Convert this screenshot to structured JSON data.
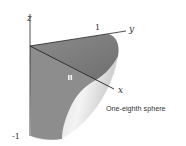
{
  "figure": {
    "caption": "One-eighth sphere",
    "axes": {
      "z_label": "z",
      "y_label": "y",
      "x_label": "x",
      "y_tick": "1",
      "z_tick": "-1"
    },
    "marker_label": "▮▮",
    "colors": {
      "flat_face": "#8a8a8a",
      "top_face": "#7a7a7a",
      "curved_light": "#e8e8e8",
      "curved_mid": "#bdbdbd",
      "axis": "#222222"
    }
  }
}
